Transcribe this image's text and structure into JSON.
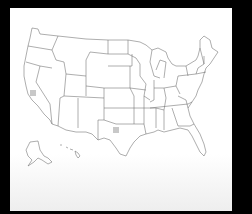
{
  "map": {
    "region": "United States",
    "style": "outline",
    "background": "#000000",
    "panel_color": "#ffffff",
    "border_color": "#6a6a6a",
    "insets": [
      "Alaska",
      "Hawaii"
    ],
    "markers": [
      {
        "state": "California",
        "color": "#c8c8c8"
      },
      {
        "state": "Texas",
        "color": "#c8c8c8"
      }
    ]
  }
}
